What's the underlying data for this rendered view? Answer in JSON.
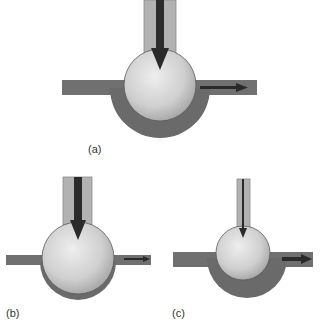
{
  "figure": {
    "panels": [
      {
        "id": "a",
        "label": "(a)",
        "description": "Ball valve with large inlet flow and small outlet flow; thick bowl"
      },
      {
        "id": "b",
        "label": "(b)",
        "description": "Ball valve with large inlet flow and very small outlet flow; thin bowl"
      },
      {
        "id": "c",
        "label": "(c)",
        "description": "Ball valve with small inlet flow and larger outlet flow; thick bowl"
      }
    ],
    "colors": {
      "pipe_dark": "#6e6e6e",
      "tube_light": "#b4b4b4",
      "ball_light": "#e6e6e6",
      "ball_dark": "#a0a0a0",
      "arrow": "#2a2a2a",
      "outline": "#4a4a4a"
    }
  }
}
